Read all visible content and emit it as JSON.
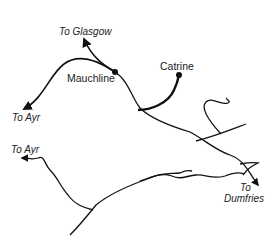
{
  "map": {
    "places": [
      {
        "name": "Mauchline",
        "type": "station"
      },
      {
        "name": "Catrine",
        "type": "station"
      }
    ],
    "destinations": [
      {
        "label": "To Glasgow"
      },
      {
        "label": "To Ayr"
      },
      {
        "label": "To Ayr"
      },
      {
        "label": "To"
      },
      {
        "label": "Dumfries"
      }
    ],
    "colors": {
      "line": "#111111",
      "text": "#222222",
      "background": "#ffffff"
    }
  }
}
